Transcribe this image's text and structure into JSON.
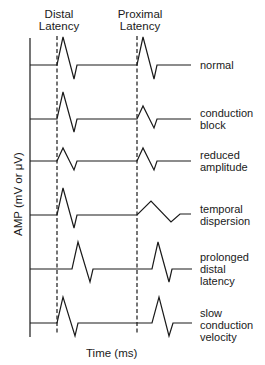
{
  "header": {
    "distal_line1": "Distal",
    "distal_line2": "Latency",
    "proximal_line1": "Proximal",
    "proximal_line2": "Latency"
  },
  "axes": {
    "ylabel": "AMP (mV or μV)",
    "xlabel": "Time (ms)"
  },
  "rows": [
    {
      "line1": "normal",
      "line2": "",
      "line3": ""
    },
    {
      "line1": "conduction",
      "line2": "block",
      "line3": ""
    },
    {
      "line1": "reduced",
      "line2": "amplitude",
      "line3": ""
    },
    {
      "line1": "temporal",
      "line2": "dispersion",
      "line3": ""
    },
    {
      "line1": "prolonged",
      "line2": "distal",
      "line3": "latency"
    },
    {
      "line1": "slow",
      "line2": "conduction",
      "line3": "velocity"
    }
  ],
  "colors": {
    "ink": "#1a1a1a",
    "background": "#ffffff"
  }
}
